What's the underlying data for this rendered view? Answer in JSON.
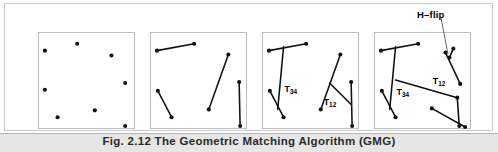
{
  "figure": {
    "caption": "Fig. 2.12 The Geometric Matching Algorithm (GMG)",
    "annotation_label": "H–flip",
    "stroke_color": "#111111",
    "panel_border_color": "#bdbdbd",
    "frame_border_color": "#c9c9c9",
    "caption_band_color": "#e6e6e6"
  },
  "panels": [
    {
      "name": "panel-points",
      "index": 1,
      "description": "scattered feature points",
      "points": [
        {
          "x": 6,
          "y": 18
        },
        {
          "x": 39,
          "y": 11
        },
        {
          "x": 74,
          "y": 23
        },
        {
          "x": 6,
          "y": 58
        },
        {
          "x": 88,
          "y": 51
        },
        {
          "x": 19,
          "y": 86
        },
        {
          "x": 57,
          "y": 79
        },
        {
          "x": 88,
          "y": 95
        }
      ],
      "segments": [],
      "labels": []
    },
    {
      "name": "panel-pairs",
      "index": 2,
      "description": "points paired into four segments",
      "points": [],
      "segments": [
        {
          "name": "seg-top",
          "x1": 6,
          "y1": 18,
          "x2": 44,
          "y2": 11
        },
        {
          "name": "seg-lower-left",
          "x1": 7,
          "y1": 59,
          "x2": 21,
          "y2": 86
        },
        {
          "name": "seg-diagonal",
          "x1": 79,
          "y1": 22,
          "x2": 59,
          "y2": 78
        },
        {
          "name": "seg-vertical",
          "x1": 90,
          "y1": 50,
          "x2": 91,
          "y2": 95
        }
      ],
      "labels": []
    },
    {
      "name": "panel-transversals",
      "index": 3,
      "description": "transversals T34 and T12 added to each pair of segments",
      "points": [],
      "segments": [
        {
          "name": "seg-top",
          "x1": 6,
          "y1": 18,
          "x2": 44,
          "y2": 11
        },
        {
          "name": "seg-lower-left",
          "x1": 7,
          "y1": 59,
          "x2": 21,
          "y2": 86
        },
        {
          "name": "transversal-34",
          "x1": 21,
          "y1": 14,
          "x2": 15,
          "y2": 78
        },
        {
          "name": "seg-diagonal",
          "x1": 79,
          "y1": 22,
          "x2": 59,
          "y2": 78
        },
        {
          "name": "seg-vertical",
          "x1": 90,
          "y1": 50,
          "x2": 91,
          "y2": 95
        },
        {
          "name": "transversal-12",
          "x1": 68,
          "y1": 51,
          "x2": 90,
          "y2": 73
        }
      ],
      "labels": [
        {
          "name": "label-t34",
          "base": "T",
          "sub": "34",
          "x": 22,
          "y": 60
        },
        {
          "name": "label-t12",
          "base": "T",
          "sub": "12",
          "x": 62,
          "y": 74
        }
      ]
    },
    {
      "name": "panel-merged",
      "index": 4,
      "description": "structures merged by a connecting line; right structure horizontally flipped",
      "points": [],
      "segments": [
        {
          "name": "seg-top",
          "x1": 6,
          "y1": 18,
          "x2": 44,
          "y2": 11
        },
        {
          "name": "seg-lower-left",
          "x1": 7,
          "y1": 59,
          "x2": 21,
          "y2": 86
        },
        {
          "name": "transversal-34",
          "x1": 21,
          "y1": 14,
          "x2": 15,
          "y2": 78
        },
        {
          "name": "connector",
          "x1": 21,
          "y1": 48,
          "x2": 84,
          "y2": 66
        },
        {
          "name": "seg-flipped-diagonal",
          "x1": 72,
          "y1": 20,
          "x2": 87,
          "y2": 52
        },
        {
          "name": "seg-flipped-short",
          "x1": 80,
          "y1": 16,
          "x2": 76,
          "y2": 25
        },
        {
          "name": "seg-flipped-vertical",
          "x1": 84,
          "y1": 66,
          "x2": 86,
          "y2": 95
        },
        {
          "name": "seg-lower-right",
          "x1": 58,
          "y1": 77,
          "x2": 92,
          "y2": 96
        }
      ],
      "labels": [
        {
          "name": "label-t34",
          "base": "T",
          "sub": "34",
          "x": 22,
          "y": 63
        },
        {
          "name": "label-t12",
          "base": "T",
          "sub": "12",
          "x": 59,
          "y": 52
        }
      ]
    }
  ]
}
